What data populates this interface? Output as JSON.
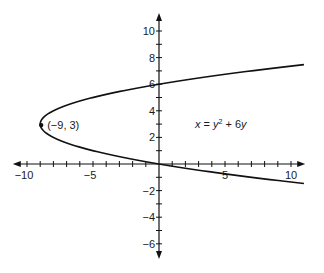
{
  "chart_data": {
    "type": "line",
    "title": "",
    "xlabel": "",
    "ylabel": "",
    "xlim": [
      -11,
      11
    ],
    "ylim": [
      -7,
      11
    ],
    "grid": false,
    "legend": null,
    "x_ticks": [
      -10,
      -9,
      -8,
      -7,
      -6,
      -5,
      -4,
      -3,
      -2,
      -1,
      1,
      2,
      3,
      4,
      5,
      6,
      7,
      8,
      9,
      10
    ],
    "x_tick_labels": [
      {
        "value": -10,
        "label": "−10"
      },
      {
        "value": -5,
        "label": "−5"
      },
      {
        "value": 5,
        "label": "5"
      },
      {
        "value": 10,
        "label": "10"
      }
    ],
    "y_ticks": [
      -6,
      -5,
      -4,
      -3,
      -2,
      -1,
      1,
      2,
      3,
      4,
      5,
      6,
      7,
      8,
      9,
      10
    ],
    "y_tick_labels": [
      {
        "value": 10,
        "label": "10"
      },
      {
        "value": 8,
        "label": "8"
      },
      {
        "value": 6,
        "label": "6"
      },
      {
        "value": 4,
        "label": "4"
      },
      {
        "value": 2,
        "label": "2"
      },
      {
        "value": -2,
        "label": "−2"
      },
      {
        "value": -4,
        "label": "−4"
      },
      {
        "value": -6,
        "label": "−6"
      }
    ],
    "series": [
      {
        "name": "parabola",
        "equation_label": "x = y² + 6y",
        "param": "y",
        "vertex": {
          "x": -9,
          "y": 3
        },
        "y_range": [
          -1.47,
          7.47
        ],
        "points": [
          {
            "x": 11,
            "y": -1.47
          },
          {
            "x": 5,
            "y": -0.74
          },
          {
            "x": 0,
            "y": 0
          },
          {
            "x": -5,
            "y": 1
          },
          {
            "x": -8,
            "y": 2
          },
          {
            "x": -9,
            "y": 3
          },
          {
            "x": -8,
            "y": 4
          },
          {
            "x": -5,
            "y": 5
          },
          {
            "x": 0,
            "y": 6
          },
          {
            "x": 5,
            "y": 6.74
          },
          {
            "x": 11,
            "y": 7.47
          }
        ]
      }
    ],
    "annotations": [
      {
        "text": "(−9, 3)",
        "x": -9,
        "y": 3,
        "type": "point-label"
      },
      {
        "text": "x = y² + 6y",
        "x": 3.5,
        "y": 3,
        "type": "equation"
      }
    ]
  },
  "labels": {
    "vertex": "(−9, 3)",
    "eq_x": "x",
    "eq_eq": " = ",
    "eq_y": "y",
    "eq_sup": "2",
    "eq_rest": " + 6",
    "eq_y2": "y"
  }
}
